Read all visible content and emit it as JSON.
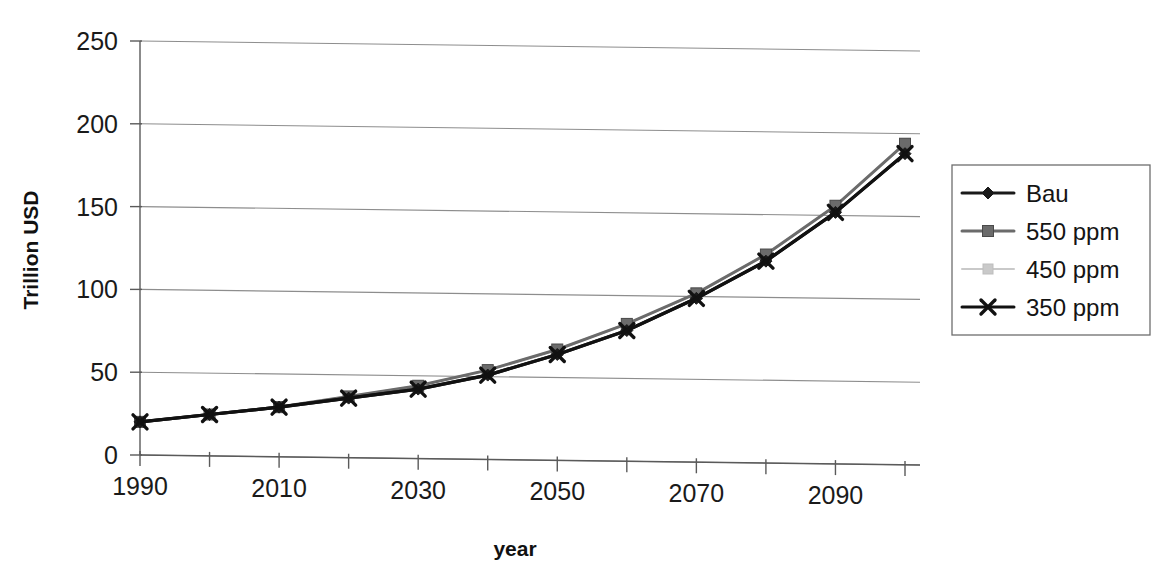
{
  "chart_data": {
    "type": "line",
    "title": "",
    "xlabel": "year",
    "ylabel": "Trillion USD",
    "xlim": [
      1990,
      2100
    ],
    "ylim": [
      0,
      250
    ],
    "yticks": [
      0,
      50,
      100,
      150,
      200,
      250
    ],
    "ytick_labels": [
      "0",
      "50",
      "100",
      "150",
      "200",
      "250"
    ],
    "xticks": [
      1990,
      2000,
      2010,
      2020,
      2030,
      2040,
      2050,
      2060,
      2070,
      2080,
      2090,
      2100
    ],
    "xtick_labels": [
      "1990",
      "",
      "2010",
      "",
      "2030",
      "",
      "2050",
      "",
      "2070",
      "",
      "2090",
      ""
    ],
    "xtick_labels_shown": [
      "1990",
      "2010",
      "2030",
      "2050",
      "2070",
      "2090"
    ],
    "grid": "horizontal",
    "legend_position": "right",
    "x": [
      1990,
      2000,
      2010,
      2020,
      2030,
      2040,
      2050,
      2060,
      2070,
      2080,
      2090,
      2100
    ],
    "series": [
      {
        "name": "Bau",
        "marker": "diamond",
        "color": "#1a1a1a",
        "values": [
          20,
          25,
          30,
          36,
          42,
          51,
          64,
          79,
          99,
          122,
          152,
          188
        ]
      },
      {
        "name": "550 ppm",
        "marker": "square",
        "color": "#6b6b6b",
        "values": [
          20,
          25,
          30,
          37,
          44,
          54,
          67,
          83,
          102,
          126,
          156,
          194
        ]
      },
      {
        "name": "450 ppm",
        "marker": "square-light",
        "color": "#c9c9c9",
        "values": [
          20,
          25,
          30,
          37,
          44,
          54,
          67,
          83,
          102,
          126,
          156,
          194
        ]
      },
      {
        "name": "350 ppm",
        "marker": "x",
        "color": "#111111",
        "values": [
          20,
          25,
          30,
          36,
          42,
          51,
          64,
          79,
          99,
          122,
          152,
          188
        ]
      }
    ]
  },
  "legend": {
    "items": [
      {
        "label": "Bau",
        "marker": "diamond-marker",
        "color": "#1a1a1a"
      },
      {
        "label": "550 ppm",
        "marker": "square-marker",
        "color": "#6b6b6b"
      },
      {
        "label": "450 ppm",
        "marker": "square-light-marker",
        "color": "#c9c9c9"
      },
      {
        "label": "350 ppm",
        "marker": "x-marker",
        "color": "#111111"
      }
    ]
  },
  "axes": {
    "y_title": "Trillion USD",
    "x_title": "year"
  },
  "colors": {
    "bau": "#1a1a1a",
    "ppm550": "#6b6b6b",
    "ppm450": "#c9c9c9",
    "ppm350": "#111111",
    "grid": "#8d8d8d",
    "axis": "#5a5a5a",
    "background": "#ffffff"
  }
}
